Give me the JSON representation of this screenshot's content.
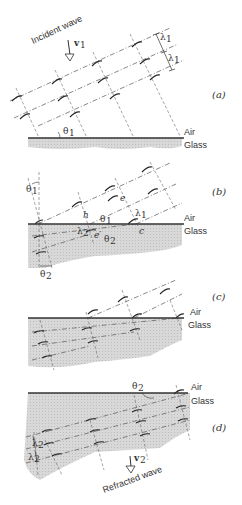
{
  "figure": {
    "panels": [
      {
        "id": "a",
        "label": "(a)",
        "labels": {
          "incident": "Incident wave",
          "velocity": "v",
          "velocity_sub": "1",
          "wavelength": "λ",
          "wavelength_sub": "1",
          "angle": "θ",
          "angle_sub": "1",
          "air": "Air",
          "glass": "Glass"
        }
      },
      {
        "id": "b",
        "label": "(b)",
        "labels": {
          "theta1": "θ",
          "theta1_sub": "1",
          "h": "h",
          "e": "e",
          "e_prime": "e′",
          "c": "c",
          "lambda1": "λ",
          "lambda1_sub": "1",
          "lambda2": "λ",
          "lambda2_sub": "2",
          "theta2": "θ",
          "theta2_sub": "2",
          "air": "Air",
          "glass": "Glass"
        }
      },
      {
        "id": "c",
        "label": "(c)",
        "labels": {
          "air": "Air",
          "glass": "Glass"
        }
      },
      {
        "id": "d",
        "label": "(d)",
        "labels": {
          "theta2": "θ",
          "theta2_sub": "2",
          "lambda2": "λ",
          "lambda2_sub": "2",
          "velocity": "v",
          "velocity_sub": "2",
          "refracted": "Refracted wave",
          "air": "Air",
          "glass": "Glass"
        }
      }
    ],
    "colors": {
      "glass_fill": "#d4d4d4",
      "line": "#333333",
      "background": "#ffffff"
    }
  }
}
